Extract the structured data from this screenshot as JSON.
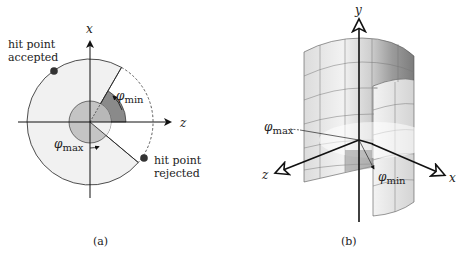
{
  "figure_a": {
    "caption": "(a)",
    "axis_x_label": "x",
    "axis_z_label": "z",
    "phi_min_label": "φ",
    "phi_min_sub": "min",
    "phi_max_label": "φ",
    "phi_max_sub": "max",
    "accepted_label_line1": "hit point",
    "accepted_label_line2": "accepted",
    "rejected_label_line1": "hit point",
    "rejected_label_line2": "rejected",
    "colors": {
      "disk_fill": "#f1f1f1",
      "phi_min_wedge": "#8a8a8a",
      "inner_circle": "#c4c4c4",
      "phi_max_wedge": "#b0b0b0",
      "stroke": "#222222",
      "hit_point": "#333333"
    }
  },
  "figure_b": {
    "caption": "(b)",
    "axis_y_label": "y",
    "axis_z_label": "z",
    "axis_x_label": "x",
    "phi_max_label": "φ",
    "phi_max_sub": "max",
    "phi_min_label": "φ",
    "phi_min_sub": "min"
  }
}
